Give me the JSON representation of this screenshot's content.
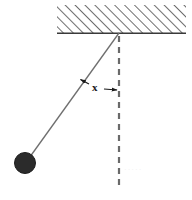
{
  "figure": {
    "background_color": "#ffffff",
    "width": 192,
    "height": 200
  },
  "ceiling": {
    "name": "hatched-ceiling",
    "hatch_color": "#555555",
    "baseline_color": "#3a3a3a",
    "left": 57,
    "right": 186,
    "top": 5,
    "baseline_y": 33,
    "hatch_angle_deg": 45
  },
  "pivot": {
    "name": "pivot-point",
    "x": 119,
    "y": 33
  },
  "vertical_reference": {
    "name": "vertical-dashed-line",
    "color": "#6a6a6a",
    "x": 119,
    "y_start": 36,
    "y_end": 190,
    "dash": "6 5",
    "width": 2.2
  },
  "string": {
    "name": "pendulum-string",
    "color": "#6f6f6f",
    "x1": 119,
    "y1": 33,
    "x2": 27,
    "y2": 161,
    "width": 1.3
  },
  "bob": {
    "name": "pendulum-bob",
    "color": "#2b2b2b",
    "cx": 25,
    "cy": 163,
    "r": 10.5
  },
  "angle_annotation": {
    "name": "angle-dimension",
    "label": "x",
    "label_x": 92,
    "label_y": 82,
    "color": "#1a1a1a",
    "arrow_from_x": 80,
    "arrow_from_y": 79,
    "arrow_to_x": 118,
    "arrow_to_y": 90,
    "mid_x": 97,
    "mid_y": 88
  },
  "watermark": {
    "name": "faint-watermark",
    "text": "·····",
    "x": 124,
    "y": 166,
    "color": "#f0f0f0"
  }
}
